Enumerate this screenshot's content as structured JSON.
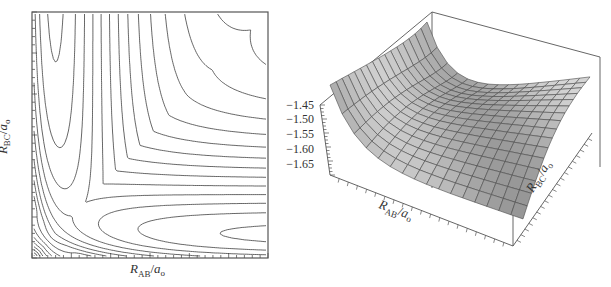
{
  "chart_data": [
    {
      "type": "contour",
      "title": "",
      "xlabel": "R_AB/a_0",
      "ylabel": "R_BC/a_0",
      "xlabel_parts": {
        "main": "R",
        "sub": "AB",
        "over": "a",
        "over_sub": "0"
      },
      "ylabel_parts": {
        "main": "R",
        "sub": "BC",
        "over": "a",
        "over_sub": "0"
      },
      "tick_labels_x": [],
      "tick_labels_y": [],
      "grid": false,
      "description": "Potential energy surface contour plot for collinear A+BC reaction; symmetric L-shaped contours with saddle point near the corner, valleys along both axes",
      "contour_count_approx": 24
    },
    {
      "type": "surface3d",
      "title": "",
      "xlabel": "R_AB/a_0",
      "ylabel": "R_BC/a_0",
      "zlabel": "",
      "xlabel_parts": {
        "main": "R",
        "sub": "AB",
        "over": "a",
        "over_sub": "0"
      },
      "ylabel_parts": {
        "main": "R",
        "sub": "BC",
        "over": "a",
        "over_sub": "0"
      },
      "z_tick_labels": [
        "-1.45",
        "-1.50",
        "-1.55",
        "-1.60",
        "-1.65"
      ],
      "zlim": [
        -1.67,
        -1.44
      ],
      "grid": "mesh 16x16",
      "surface_color": "#c8c8c8"
    }
  ],
  "left": {
    "xlabel": {
      "R": "R",
      "sub": "AB",
      "slash": "/",
      "a": "a",
      "asub": "o"
    },
    "ylabel": {
      "R": "R",
      "sub": "BC",
      "slash": "/",
      "a": "a",
      "asub": "o"
    }
  },
  "right": {
    "xlabel": {
      "R": "R",
      "sub": "AB",
      "slash": "/",
      "a": "a",
      "asub": "o"
    },
    "ylabel": {
      "R": "R",
      "sub": "BC",
      "slash": "/",
      "a": "a",
      "asub": "o"
    },
    "zticks": [
      "−1.45",
      "−1.50",
      "−1.55",
      "−1.60",
      "−1.65"
    ]
  },
  "colors": {
    "line": "#333333",
    "frame": "#555555",
    "surface": "#c9c9c9",
    "mesh": "#4a4a4a"
  }
}
